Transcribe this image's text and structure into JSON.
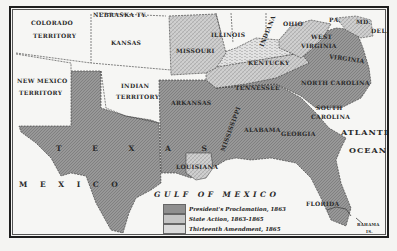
{
  "map": {
    "title": "Emancipation of the Slaves",
    "colors": {
      "presidents_proclamation": "#8f8f8f",
      "state_action": "#c4c4c4",
      "thirteenth_amendment": "#dadada",
      "free": "#f6f6f4",
      "border": "#1e1e1e"
    },
    "labels": {
      "colorado": "COLORADO",
      "colorado2": "TERRITORY",
      "nebraska": "NEBRASKA TY.",
      "kansas": "KANSAS",
      "missouri": "MISSOURI",
      "illinois": "ILLINOIS",
      "indiana": "INDIANA",
      "ohio": "OHIO",
      "pa": "PA.",
      "md": "MD.",
      "del": "DEL.",
      "west_virginia": "WEST",
      "west_virginia2": "VIRGINIA",
      "virginia": "VIRGINIA",
      "kentucky": "KENTUCKY",
      "new_mexico": "NEW MEXICO",
      "new_mexico2": "TERRITORY",
      "indian_territory": "INDIAN",
      "indian_territory2": "TERRITORY",
      "arkansas": "ARKANSAS",
      "tennessee": "TENNESSEE",
      "north_carolina": "NORTH CAROLINA",
      "south_carolina": "SOUTH",
      "south_carolina2": "CAROLINA",
      "mississippi": "MISSISSIPPI",
      "alabama": "ALABAMA",
      "georgia": "GEORGIA",
      "texas": "T E X A S",
      "louisiana": "LOUISIANA",
      "florida": "FLORIDA",
      "mexico": "M E X I C O",
      "gulf": "GULF OF MEXICO",
      "atlantic": "ATLANTIC",
      "ocean": "OCEAN",
      "bahama": "BAHAMA",
      "bahama2": "IS."
    },
    "legend": [
      {
        "label": "President's Proclamation, 1863",
        "pattern": "dark"
      },
      {
        "label": "State Action, 1863-1865",
        "pattern": "medium"
      },
      {
        "label": "Thirteenth Amendment, 1865",
        "pattern": "light"
      }
    ]
  }
}
